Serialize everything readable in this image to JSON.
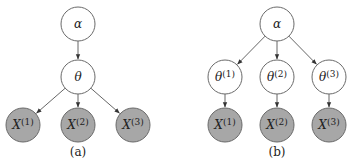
{
  "panels": [
    {
      "caption": "(a)",
      "nodes": [
        {
          "id": "alpha",
          "label": "α",
          "sup": "",
          "observed": false
        },
        {
          "id": "theta",
          "label": "θ",
          "sup": "",
          "observed": false
        },
        {
          "id": "x1",
          "label": "X",
          "sup": "(1)",
          "observed": true
        },
        {
          "id": "x2",
          "label": "X",
          "sup": "(2)",
          "observed": true
        },
        {
          "id": "x3",
          "label": "X",
          "sup": "(3)",
          "observed": true
        }
      ],
      "edges": [
        [
          "alpha",
          "theta"
        ],
        [
          "theta",
          "x1"
        ],
        [
          "theta",
          "x2"
        ],
        [
          "theta",
          "x3"
        ]
      ]
    },
    {
      "caption": "(b)",
      "nodes": [
        {
          "id": "alpha",
          "label": "α",
          "sup": "",
          "observed": false
        },
        {
          "id": "theta1",
          "label": "θ",
          "sup": "(1)",
          "observed": false
        },
        {
          "id": "theta2",
          "label": "θ",
          "sup": "(2)",
          "observed": false
        },
        {
          "id": "theta3",
          "label": "θ",
          "sup": "(3)",
          "observed": false
        },
        {
          "id": "x1",
          "label": "X",
          "sup": "(1)",
          "observed": true
        },
        {
          "id": "x2",
          "label": "X",
          "sup": "(2)",
          "observed": true
        },
        {
          "id": "x3",
          "label": "X",
          "sup": "(3)",
          "observed": true
        }
      ],
      "edges": [
        [
          "alpha",
          "theta1"
        ],
        [
          "alpha",
          "theta2"
        ],
        [
          "alpha",
          "theta3"
        ],
        [
          "theta1",
          "x1"
        ],
        [
          "theta2",
          "x2"
        ],
        [
          "theta3",
          "x3"
        ]
      ]
    }
  ],
  "colors": {
    "observed_fill": "#a7a7a7",
    "open_fill": "#ffffff",
    "stroke": "#6a6a6a"
  }
}
